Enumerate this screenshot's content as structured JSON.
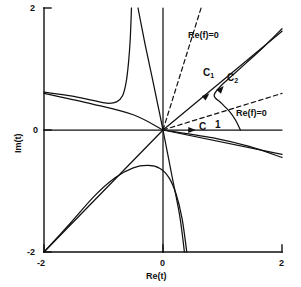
{
  "figure": {
    "kind": "complex-plane-contour-plot",
    "background": "#ffffff",
    "ink": "#111111"
  },
  "axes": {
    "x_title": "Re(t)",
    "y_title": "Im(t)",
    "x_ticks": [
      "-2",
      "0",
      "2"
    ],
    "y_ticks": [
      "-2",
      "0",
      "2"
    ],
    "xlim": [
      -2,
      2
    ],
    "ylim": [
      -2,
      2
    ],
    "grid": false
  },
  "annotations": {
    "refzero_upper": "Re(f)=0",
    "refzero_lower": "Re(f)=0",
    "contour_c": "C",
    "contour_c1_base": "C",
    "contour_c1_sub": "1",
    "contour_c2_base": "C",
    "contour_c2_sub": "2",
    "point_one": "1"
  },
  "chart_data": {
    "type": "line",
    "title": "",
    "xlabel": "Re(t)",
    "ylabel": "Im(t)",
    "xlim": [
      -2,
      2
    ],
    "ylim": [
      -2,
      2
    ],
    "grid": false,
    "legend": "none",
    "series": [
      {
        "name": "real-axis-contour-C",
        "style": "solid",
        "arrow": {
          "at": [
            0.55,
            0.0
          ],
          "direction": "right"
        },
        "points": [
          [
            -2,
            0
          ],
          [
            2,
            0
          ]
        ]
      },
      {
        "name": "imaginary-axis",
        "style": "solid",
        "points": [
          [
            0,
            -2
          ],
          [
            0,
            2
          ]
        ]
      },
      {
        "name": "steepest-descent-C1",
        "style": "solid",
        "arrow": {
          "at": [
            0.78,
            0.6
          ],
          "direction": "up-right"
        },
        "points": [
          [
            0,
            0
          ],
          [
            2,
            1.62
          ]
        ]
      },
      {
        "name": "steepest-descent-C2",
        "style": "solid",
        "arrow": {
          "at": [
            1.02,
            0.72
          ],
          "direction": "up-right"
        },
        "points": [
          [
            1.3,
            0.0
          ],
          [
            1.22,
            0.16
          ],
          [
            1.12,
            0.3
          ],
          [
            0.98,
            0.44
          ],
          [
            0.86,
            0.56
          ],
          [
            0.95,
            0.7
          ],
          [
            1.15,
            0.88
          ],
          [
            1.4,
            1.1
          ],
          [
            1.7,
            1.37
          ],
          [
            2.0,
            1.66
          ]
        ]
      },
      {
        "name": "branch-lower-right-pair-a",
        "style": "solid",
        "points": [
          [
            0,
            0
          ],
          [
            2,
            -0.4
          ]
        ]
      },
      {
        "name": "branch-lower-right-pair-b",
        "style": "solid",
        "points": [
          [
            0,
            0
          ],
          [
            0.9,
            -0.14
          ],
          [
            1.45,
            -0.27
          ],
          [
            2,
            -0.45
          ]
        ]
      },
      {
        "name": "branch-upper-left-asymptote",
        "style": "solid",
        "points": [
          [
            -2,
            0.6
          ],
          [
            -1.2,
            0.43
          ],
          [
            -0.5,
            0.25
          ],
          [
            0,
            0
          ]
        ]
      },
      {
        "name": "branch-upper-left-hyperbola",
        "style": "solid",
        "points": [
          [
            -2,
            0.62
          ],
          [
            -1.55,
            0.56
          ],
          [
            -1.2,
            0.49
          ],
          [
            -0.95,
            0.44
          ],
          [
            -0.78,
            0.46
          ],
          [
            -0.68,
            0.56
          ],
          [
            -0.62,
            0.78
          ],
          [
            -0.58,
            1.1
          ],
          [
            -0.55,
            1.5
          ],
          [
            -0.53,
            2.0
          ]
        ]
      },
      {
        "name": "branch-upper-steep-descending",
        "style": "solid",
        "points": [
          [
            -0.42,
            2.0
          ],
          [
            -0.3,
            1.4
          ],
          [
            -0.18,
            0.85
          ],
          [
            -0.08,
            0.38
          ],
          [
            0,
            0
          ]
        ]
      },
      {
        "name": "branch-lower-left-line",
        "style": "solid",
        "points": [
          [
            -2,
            -2
          ],
          [
            0,
            0
          ]
        ]
      },
      {
        "name": "branch-lower-left-arc",
        "style": "solid",
        "points": [
          [
            -2,
            -2
          ],
          [
            -1.55,
            -1.52
          ],
          [
            -1.15,
            -1.08
          ],
          [
            -0.8,
            -0.78
          ],
          [
            -0.5,
            -0.62
          ],
          [
            -0.25,
            -0.58
          ],
          [
            -0.05,
            -0.63
          ],
          [
            0.1,
            -0.78
          ],
          [
            0.22,
            -1.05
          ],
          [
            0.32,
            -1.45
          ],
          [
            0.4,
            -2.0
          ]
        ]
      },
      {
        "name": "branch-lower-steep-from-origin",
        "style": "solid",
        "points": [
          [
            0,
            0
          ],
          [
            0.15,
            -0.75
          ],
          [
            0.28,
            -1.4
          ],
          [
            0.36,
            -2.0
          ]
        ]
      },
      {
        "name": "refzero-line-upper",
        "style": "dashed",
        "points": [
          [
            0,
            0
          ],
          [
            0.64,
            2.0
          ]
        ]
      },
      {
        "name": "refzero-line-lower",
        "style": "dashed",
        "points": [
          [
            0,
            0
          ],
          [
            2,
            0.6
          ]
        ]
      }
    ]
  }
}
